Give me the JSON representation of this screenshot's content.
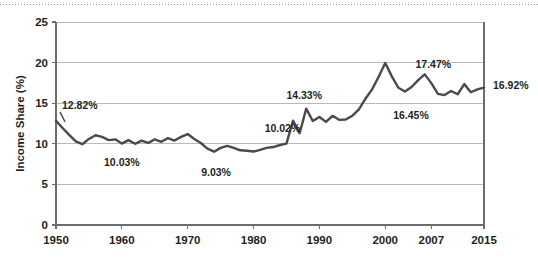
{
  "chart_data": {
    "type": "line",
    "title": "",
    "subtitle": "",
    "xlabel": "",
    "ylabel": "Income Share (%)",
    "xlim": [
      1950,
      2015
    ],
    "ylim": [
      0,
      25
    ],
    "ytick_labels": [
      "0",
      "5",
      "10",
      "15",
      "20",
      "25"
    ],
    "ytick_values": [
      0,
      5,
      10,
      15,
      20,
      25
    ],
    "xtick_labels": [
      "1950",
      "1960",
      "1970",
      "1980",
      "1990",
      "2000",
      "2007",
      "2015"
    ],
    "xtick_values": [
      1950,
      1960,
      1970,
      1980,
      1990,
      2000,
      2007,
      2015
    ],
    "grid": "horizontal",
    "legend": "none",
    "line_color": "#4a4a4a",
    "grid_color": "#b9b9b9",
    "axis_color": "#6d6d6d",
    "series": [
      {
        "name": "Income Share",
        "x": [
          1950,
          1951,
          1952,
          1953,
          1954,
          1955,
          1956,
          1957,
          1958,
          1959,
          1960,
          1961,
          1962,
          1963,
          1964,
          1965,
          1966,
          1967,
          1968,
          1969,
          1970,
          1971,
          1972,
          1973,
          1974,
          1975,
          1976,
          1977,
          1978,
          1979,
          1980,
          1981,
          1982,
          1983,
          1984,
          1985,
          1986,
          1987,
          1988,
          1989,
          1990,
          1991,
          1992,
          1993,
          1994,
          1995,
          1996,
          1997,
          1998,
          1999,
          2000,
          2001,
          2002,
          2003,
          2004,
          2005,
          2006,
          2007,
          2008,
          2009,
          2010,
          2011,
          2012,
          2013,
          2014,
          2015
        ],
        "values": [
          12.82,
          11.95,
          11.1,
          10.3,
          9.95,
          10.6,
          11.05,
          10.85,
          10.45,
          10.55,
          10.03,
          10.45,
          10.0,
          10.4,
          10.1,
          10.55,
          10.25,
          10.7,
          10.4,
          10.85,
          11.2,
          10.6,
          10.1,
          9.4,
          9.03,
          9.5,
          9.75,
          9.5,
          9.2,
          9.15,
          9.05,
          9.25,
          9.5,
          9.6,
          9.85,
          10.02,
          12.85,
          11.3,
          14.33,
          12.8,
          13.3,
          12.7,
          13.45,
          12.95,
          13.0,
          13.45,
          14.25,
          15.55,
          16.7,
          18.25,
          19.95,
          18.3,
          16.9,
          16.45,
          17.0,
          17.85,
          18.55,
          17.47,
          16.15,
          16.0,
          16.5,
          16.1,
          17.35,
          16.35,
          16.7,
          16.92
        ]
      }
    ],
    "annotations": [
      {
        "label": "12.82%",
        "year": 1950,
        "value": 12.82
      },
      {
        "label": "10.03%",
        "year": 1960,
        "value": 10.03
      },
      {
        "label": "9.03%",
        "year": 1974,
        "value": 9.03
      },
      {
        "label": "10.02%",
        "year": 1985,
        "value": 10.02
      },
      {
        "label": "14.33%",
        "year": 1988,
        "value": 14.33
      },
      {
        "label": "16.45%",
        "year": 2003,
        "value": 16.45
      },
      {
        "label": "17.47%",
        "year": 2007,
        "value": 17.47
      },
      {
        "label": "16.92%",
        "year": 2015,
        "value": 16.92
      }
    ]
  }
}
